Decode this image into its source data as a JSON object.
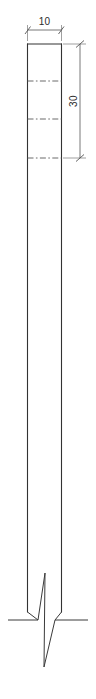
{
  "drawing": {
    "title": "Column elevation detail",
    "background_color": "#ffffff",
    "line_color": "#333333",
    "dimension_color": "#555555",
    "text_color": "#2b2b2b",
    "canvas": {
      "width": 96,
      "height": 699
    }
  },
  "dimensions": {
    "width_label": "10",
    "height_label": "30"
  },
  "labels": {
    "width_dimension_name": "width-dimension",
    "height_dimension_name": "height-dimension"
  },
  "geometry": {
    "column": {
      "left": 27.5,
      "right": 61.5,
      "top": 44,
      "bottom": 620
    },
    "center_lines_y": [
      81,
      119,
      158
    ],
    "width_dim_y": 30,
    "height_dim_x": 80,
    "height_dim_top": 44,
    "height_dim_bottom": 158,
    "ground_line": {
      "x1": 8,
      "x2": 88,
      "y": 620
    },
    "break_symbol": {
      "apex_top_x": 45,
      "apex_top_y": 573,
      "apex_bottom_x": 44,
      "apex_bottom_y": 667
    }
  }
}
